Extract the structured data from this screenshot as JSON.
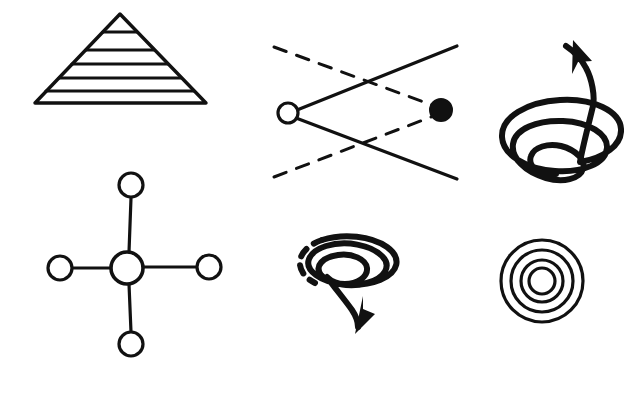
{
  "page": {
    "background_color": "#ffffff",
    "ink_color": "#111111",
    "width": 624,
    "height": 398
  },
  "figures": [
    {
      "id": "pyramid",
      "name": "layered-pyramid-diagram",
      "label": "Layered pyramid",
      "type": "pyramid",
      "apex": {
        "x": 120,
        "y": 14
      },
      "base_left": {
        "x": 35,
        "y": 103
      },
      "base_right": {
        "x": 206,
        "y": 103
      },
      "stroke_width": 3.2,
      "tier_count": 6,
      "divider_y": [
        32,
        50,
        64,
        78,
        91
      ],
      "dividers": [
        {
          "y": 32,
          "x1": 103,
          "x2": 137
        },
        {
          "y": 50,
          "x1": 86,
          "x2": 154
        },
        {
          "y": 64,
          "x1": 72,
          "x2": 168
        },
        {
          "y": 78,
          "x1": 59,
          "x2": 181
        },
        {
          "y": 91,
          "x1": 46,
          "x2": 194
        }
      ]
    },
    {
      "id": "bowtie",
      "name": "crossing-paths-diagram",
      "label": "Crossing solid and dashed paths between hollow and filled nodes",
      "type": "node-link",
      "stroke_width": 3,
      "dash_pattern": "13 11",
      "nodes": [
        {
          "id": "source",
          "name": "hollow-node",
          "fill": "white",
          "cx": 288,
          "cy": 113,
          "r": 10
        },
        {
          "id": "target",
          "name": "filled-node",
          "fill": "black",
          "cx": 441,
          "cy": 110,
          "r": 11
        }
      ],
      "solid_edges": [
        {
          "from": {
            "x": 298,
            "y": 110
          },
          "to": {
            "x": 457,
            "y": 46
          }
        },
        {
          "from": {
            "x": 297,
            "y": 118
          },
          "to": {
            "x": 457,
            "y": 179
          }
        }
      ],
      "dashed_edges": [
        {
          "from": {
            "x": 274,
            "y": 47
          },
          "to": {
            "x": 432,
            "y": 105
          }
        },
        {
          "from": {
            "x": 274,
            "y": 177
          },
          "to": {
            "x": 431,
            "y": 117
          }
        }
      ]
    },
    {
      "id": "upward-spiral",
      "name": "upward-helix-diagram",
      "label": "Upward expanding helix with arrow",
      "type": "helix",
      "direction": "up",
      "stroke_width": 6,
      "loop_count": 3,
      "arrow_tip": {
        "x": 574,
        "y": 41
      },
      "arrow_direction": "up-left",
      "center_x": 551,
      "top_y": 55,
      "bottom_y": 175
    },
    {
      "id": "hub-spoke",
      "name": "hub-and-spoke-diagram",
      "label": "Central hub with four satellite nodes",
      "type": "node-link",
      "stroke_width": 3,
      "hub": {
        "name": "hub-node",
        "cx": 127,
        "cy": 268,
        "r": 16
      },
      "satellites": [
        {
          "name": "satellite-node-top",
          "cx": 131,
          "cy": 185,
          "r": 12
        },
        {
          "name": "satellite-node-right",
          "cx": 209,
          "cy": 267,
          "r": 12
        },
        {
          "name": "satellite-node-bottom",
          "cx": 131,
          "cy": 344,
          "r": 12
        },
        {
          "name": "satellite-node-left",
          "cx": 60,
          "cy": 268,
          "r": 12
        }
      ],
      "spokes": [
        {
          "name": "spoke-top",
          "from": {
            "x": 129,
            "y": 252
          },
          "to": {
            "x": 131,
            "y": 197
          }
        },
        {
          "name": "spoke-right",
          "from": {
            "x": 143,
            "y": 267
          },
          "to": {
            "x": 197,
            "y": 267
          }
        },
        {
          "name": "spoke-bottom",
          "from": {
            "x": 129,
            "y": 284
          },
          "to": {
            "x": 131,
            "y": 332
          }
        },
        {
          "name": "spoke-left",
          "from": {
            "x": 111,
            "y": 268
          },
          "to": {
            "x": 72,
            "y": 268
          }
        }
      ]
    },
    {
      "id": "downward-spiral",
      "name": "downward-helix-diagram",
      "label": "Downward contracting helix with dashed start and arrow",
      "type": "helix",
      "direction": "down",
      "stroke_width": 6,
      "loop_count": 3,
      "dashed_start": true,
      "dash_pattern": "9 9",
      "arrow_tip": {
        "x": 359,
        "y": 331
      },
      "arrow_direction": "down-left",
      "center_x": 345,
      "top_y": 245,
      "bottom_y": 315
    },
    {
      "id": "concentric",
      "name": "concentric-circles-diagram",
      "label": "Four concentric circles",
      "type": "concentric",
      "center": {
        "x": 542,
        "y": 281
      },
      "stroke_width": 3,
      "radii": [
        41,
        31,
        21,
        13
      ]
    }
  ]
}
